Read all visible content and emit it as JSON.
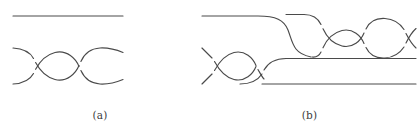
{
  "figure": {
    "kind": "knot-diagram-figure",
    "background_color": "#ffffff",
    "stroke_color": "#4a4a4a",
    "panel_count": 2
  },
  "panels": [
    {
      "id": "a",
      "caption": "(a)",
      "description": "Two-component tangle: one straight horizontal strand above a two-strand braid with three crossings",
      "components": [
        {
          "name": "top-straight-strand",
          "type": "line",
          "points": [
            [
              13,
              16
            ],
            [
              123,
              16
            ]
          ]
        },
        {
          "name": "braid-strand-upper",
          "type": "braid-strand",
          "crossings": 3,
          "y_top": 48,
          "y_bottom": 84
        },
        {
          "name": "braid-strand-lower",
          "type": "braid-strand",
          "crossings": 3,
          "y_top": 48,
          "y_bottom": 84
        }
      ],
      "crossing_positions_x": [
        32,
        77,
        110
      ],
      "lens_centers_x": [
        55,
        94
      ]
    },
    {
      "id": "b",
      "caption": "(b)",
      "description": "Two-component tangle: upper strand descends via an S-bend into a right-hand braid; lower-left braid with crossings feeds a straight lower-right strand",
      "components": [
        {
          "name": "upper-left-strand",
          "type": "line-with-sbend",
          "points": [
            [
              202,
              16
            ],
            [
              268,
              16
            ]
          ]
        },
        {
          "name": "lower-right-strand",
          "type": "line",
          "points": [
            [
              268,
              84
            ],
            [
              415,
              84
            ]
          ]
        },
        {
          "name": "left-braid-strand-upper",
          "type": "braid-strand",
          "crossings": 2,
          "y_top": 48,
          "y_bottom": 84
        },
        {
          "name": "left-braid-strand-lower",
          "type": "braid-strand",
          "crossings": 2,
          "y_top": 48,
          "y_bottom": 84
        },
        {
          "name": "right-braid-strand-upper",
          "type": "braid-strand",
          "crossings": 3,
          "y_top": 16,
          "y_bottom": 50
        },
        {
          "name": "right-braid-strand-lower",
          "type": "braid-strand",
          "crossings": 3,
          "y_top": 16,
          "y_bottom": 50
        }
      ],
      "left_crossing_positions_x": [
        208,
        247
      ],
      "right_crossing_positions_x": [
        318,
        360,
        400
      ],
      "transition_x_range": [
        262,
        300
      ]
    }
  ]
}
